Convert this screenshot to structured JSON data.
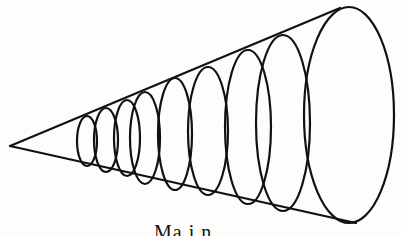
{
  "diagram": {
    "stroke_color": "#111111",
    "background": "#fdfdfb",
    "apex": [
      10,
      146
    ],
    "top_edge_end": [
      340,
      8
    ],
    "bottom_edge_end": [
      356,
      223
    ],
    "ellipses": [
      {
        "cx": 87,
        "cy": 141,
        "rx": 10,
        "ry": 25
      },
      {
        "cx": 106,
        "cy": 140,
        "rx": 12,
        "ry": 32
      },
      {
        "cx": 127,
        "cy": 138,
        "rx": 13,
        "ry": 38
      },
      {
        "cx": 145,
        "cy": 138,
        "rx": 15,
        "ry": 46
      },
      {
        "cx": 175,
        "cy": 134,
        "rx": 17,
        "ry": 56
      },
      {
        "cx": 208,
        "cy": 131,
        "rx": 20,
        "ry": 64
      },
      {
        "cx": 248,
        "cy": 127,
        "rx": 23,
        "ry": 77
      },
      {
        "cx": 283,
        "cy": 123,
        "rx": 27,
        "ry": 88
      },
      {
        "cx": 349,
        "cy": 115,
        "rx": 45,
        "ry": 108
      }
    ]
  },
  "caption": "Ma  i  n"
}
